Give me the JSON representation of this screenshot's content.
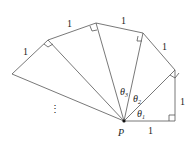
{
  "diagram": {
    "center_label": "P",
    "side_labels": [
      "1",
      "1",
      "1",
      "1",
      "1",
      "1"
    ],
    "angle_labels": [
      {
        "base": "θ",
        "sub": "1"
      },
      {
        "base": "θ",
        "sub": "2"
      },
      {
        "base": "θ",
        "sub": "3"
      }
    ],
    "ellipsis": "⋮",
    "line_color": "#555555"
  }
}
